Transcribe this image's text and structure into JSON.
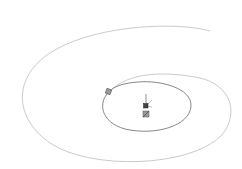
{
  "viewport": {
    "background": "#ffffff",
    "spiral_color": "#b8b8b8",
    "inner_color": "#777777",
    "marker_color": "#555555"
  },
  "sketch": {
    "entity": "spiral",
    "origin_triad": {
      "axes": [
        "y",
        "x",
        "z"
      ]
    }
  }
}
